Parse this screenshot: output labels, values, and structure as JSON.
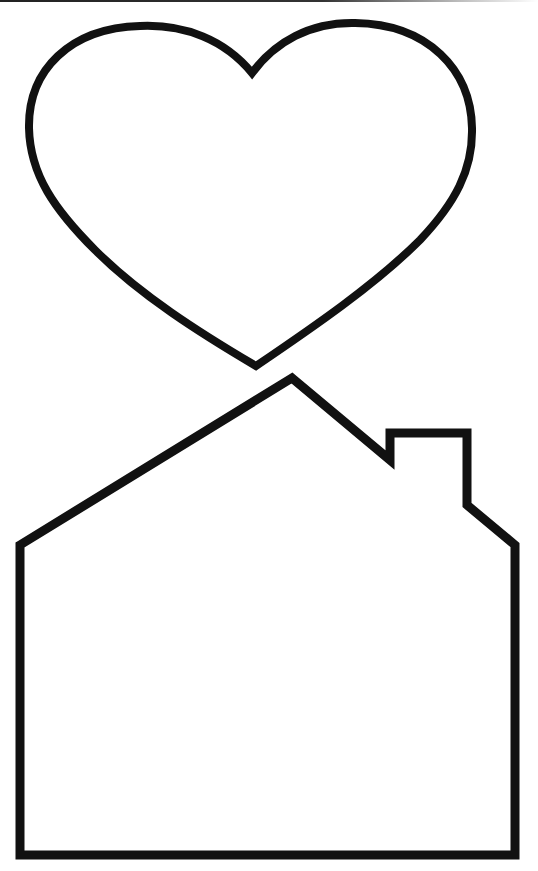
{
  "page": {
    "background": "#ffffff"
  },
  "style": {
    "stroke_color": "#111111",
    "stroke_width": 9,
    "scan_edge_color": "#222222"
  },
  "shapes": [
    {
      "name": "heart",
      "type": "outline",
      "bbox": {
        "x": 27,
        "y": 22,
        "width": 448,
        "height": 346
      }
    },
    {
      "name": "house",
      "type": "outline",
      "bbox": {
        "x": 20,
        "y": 378,
        "width": 495,
        "height": 477
      },
      "has_chimney": true
    }
  ]
}
